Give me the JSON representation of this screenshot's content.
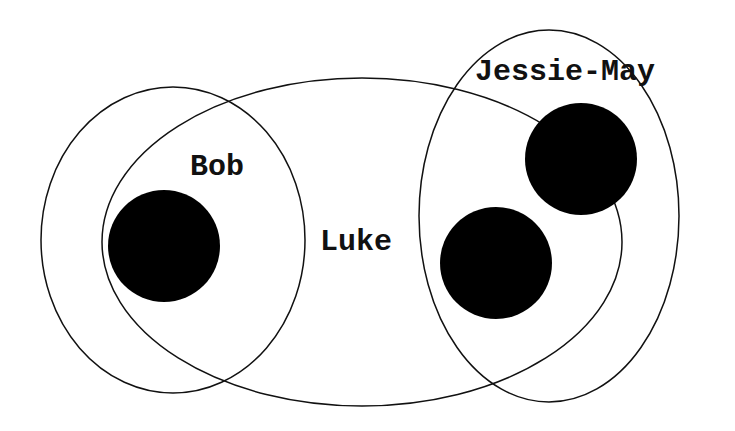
{
  "diagram": {
    "type": "euler",
    "sets": [
      {
        "id": "bob",
        "label": "Bob"
      },
      {
        "id": "luke",
        "label": "Luke"
      },
      {
        "id": "jessie",
        "label": "Jessie-May"
      }
    ],
    "colors": {
      "stroke": "#111111",
      "dot": "#000000",
      "background": "#ffffff"
    }
  }
}
